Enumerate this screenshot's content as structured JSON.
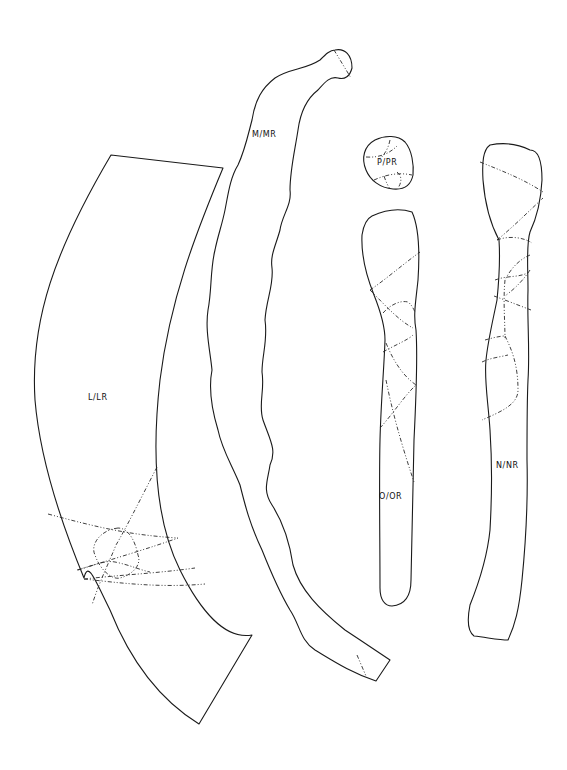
{
  "diagram": {
    "type": "sewing-pattern-pieces",
    "background": "#ffffff",
    "line_color": "#1a1a1a",
    "pieces": [
      {
        "id": "L",
        "label": "L/LR",
        "label_pos": [
          104,
          398
        ]
      },
      {
        "id": "M",
        "label": "M/MR",
        "label_pos": [
          267,
          137
        ]
      },
      {
        "id": "P",
        "label": "P/PR",
        "label_pos": [
          381,
          163
        ]
      },
      {
        "id": "O",
        "label": "O/OR",
        "label_pos": [
          393,
          497
        ]
      },
      {
        "id": "N",
        "label": "N/NR",
        "label_pos": [
          510,
          466
        ]
      }
    ]
  }
}
